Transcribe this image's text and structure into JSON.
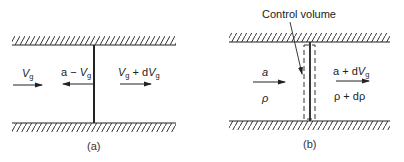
{
  "colors": {
    "ink": "#222222",
    "background": "#ffffff"
  },
  "panel_a": {
    "caption": "(a)",
    "left_label": {
      "main": "V",
      "sub": "g"
    },
    "wave_label": {
      "prefix": "a − ",
      "main": "V",
      "sub": "g"
    },
    "right_label": {
      "main1": "V",
      "sub1": "g",
      "mid": " + d",
      "main2": "V",
      "sub2": "g"
    }
  },
  "panel_b": {
    "caption": "(b)",
    "control_volume_label": "Control volume",
    "left_velocity": "a",
    "left_density": "ρ",
    "right_velocity": {
      "prefix": "a + d",
      "main": "V",
      "sub": "g"
    },
    "right_density": "ρ + dρ"
  }
}
